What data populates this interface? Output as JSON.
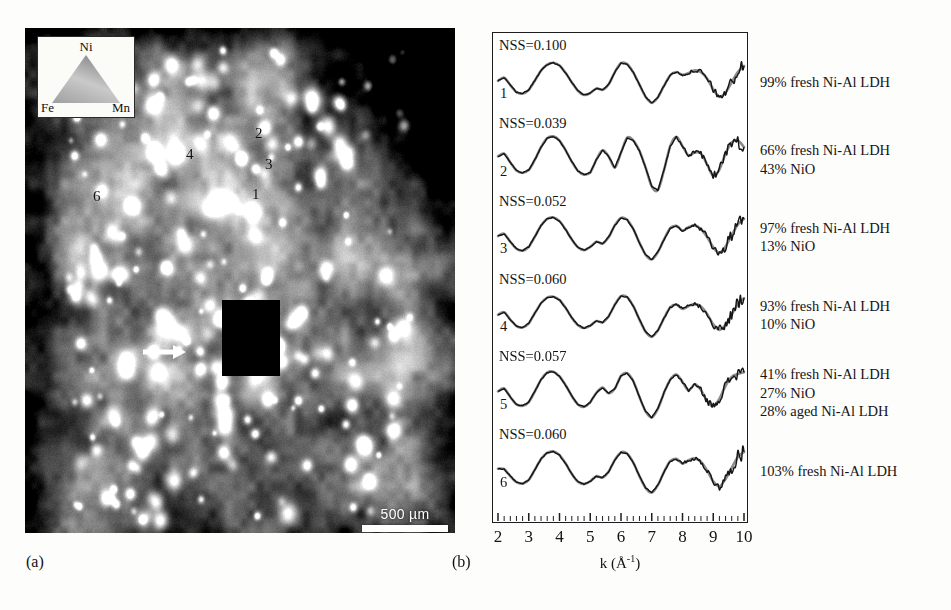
{
  "figure": {
    "panel_a_caption": "(a)",
    "panel_b_caption": "(b)"
  },
  "map": {
    "name": "elemental-distribution-map",
    "scalebar": {
      "label": "500 µm",
      "length_um": 500
    },
    "ternary_legend": {
      "top": "Ni",
      "bottom_left": "Fe",
      "bottom_right": "Mn"
    },
    "markers": [
      {
        "label": "1",
        "x": 252,
        "y": 186
      },
      {
        "label": "2",
        "x": 255,
        "y": 125
      },
      {
        "label": "3",
        "x": 265,
        "y": 156
      },
      {
        "label": "4",
        "x": 186,
        "y": 146
      },
      {
        "label": "6",
        "x": 93,
        "y": 188
      }
    ],
    "arrow": {
      "name": "white-arrow-pointer",
      "direction": "right"
    },
    "colors": {
      "background": "#6f6f6f",
      "bright_grain": "#f2f2f2",
      "dark_void": "#0d0d0d",
      "scalebar": "#ffffff"
    }
  },
  "chart_data": {
    "type": "line",
    "title": "",
    "xlabel": "k (Å-1)",
    "ylabel": "",
    "xlim": [
      2,
      10
    ],
    "xticks": [
      2,
      3,
      4,
      5,
      6,
      7,
      8,
      9,
      10
    ],
    "minor_ticks_per_interval": 5,
    "grid": false,
    "legend": "none",
    "stacked_offset": true,
    "series_pairs": [
      "data",
      "fit"
    ],
    "colors": {
      "data": "#151515",
      "fit": "#8c8c8c"
    },
    "spectra": [
      {
        "index": 1,
        "nss_label": "NSS=0.100",
        "nss": 0.1,
        "annotation": [
          "99% fresh Ni-Al LDH"
        ],
        "components": [
          {
            "phase": "fresh Ni-Al LDH",
            "percent": 99
          }
        ],
        "k": [
          2.0,
          2.2,
          2.4,
          2.6,
          2.8,
          3.0,
          3.2,
          3.4,
          3.6,
          3.8,
          4.0,
          4.2,
          4.4,
          4.6,
          4.8,
          5.0,
          5.2,
          5.4,
          5.6,
          5.8,
          6.0,
          6.2,
          6.4,
          6.6,
          6.8,
          7.0,
          7.2,
          7.4,
          7.6,
          7.8,
          8.0,
          8.2,
          8.4,
          8.6,
          8.8,
          9.0,
          9.2,
          9.4,
          9.6,
          9.8,
          10.0
        ],
        "chi": [
          0.08,
          0.22,
          -0.1,
          -0.4,
          -0.46,
          -0.3,
          0.1,
          0.52,
          0.78,
          0.86,
          0.74,
          0.42,
          0.02,
          -0.34,
          -0.52,
          -0.44,
          -0.24,
          -0.3,
          -0.06,
          0.46,
          0.84,
          0.8,
          0.44,
          -0.08,
          -0.6,
          -0.86,
          -0.62,
          -0.12,
          0.32,
          0.46,
          0.34,
          0.42,
          0.54,
          0.46,
          0.18,
          -0.28,
          -0.6,
          -0.42,
          0.02,
          0.46,
          0.72
        ]
      },
      {
        "index": 2,
        "nss_label": "NSS=0.039",
        "nss": 0.039,
        "annotation": [
          "66% fresh Ni-Al LDH",
          "43% NiO"
        ],
        "components": [
          {
            "phase": "fresh Ni-Al LDH",
            "percent": 66
          },
          {
            "phase": "NiO",
            "percent": 43
          }
        ],
        "k": [
          2.0,
          2.2,
          2.4,
          2.6,
          2.8,
          3.0,
          3.2,
          3.4,
          3.6,
          3.8,
          4.0,
          4.2,
          4.4,
          4.6,
          4.8,
          5.0,
          5.2,
          5.4,
          5.6,
          5.8,
          6.0,
          6.2,
          6.4,
          6.6,
          6.8,
          7.0,
          7.2,
          7.4,
          7.6,
          7.8,
          8.0,
          8.2,
          8.4,
          8.6,
          8.8,
          9.0,
          9.2,
          9.4,
          9.6,
          9.8,
          10.0
        ],
        "chi": [
          0.18,
          0.3,
          -0.08,
          -0.42,
          -0.52,
          -0.4,
          0.04,
          0.58,
          0.96,
          1.04,
          0.86,
          0.44,
          -0.04,
          -0.44,
          -0.6,
          -0.5,
          0.04,
          0.44,
          0.18,
          -0.3,
          0.34,
          0.98,
          0.86,
          0.42,
          -0.3,
          -1.1,
          -1.26,
          -0.4,
          0.62,
          1.02,
          0.62,
          0.22,
          0.36,
          0.3,
          -0.16,
          -0.66,
          -0.38,
          0.3,
          0.78,
          0.86,
          0.58
        ]
      },
      {
        "index": 3,
        "nss_label": "NSS=0.052",
        "nss": 0.052,
        "annotation": [
          "97% fresh Ni-Al LDH",
          "13% NiO"
        ],
        "components": [
          {
            "phase": "fresh Ni-Al LDH",
            "percent": 97
          },
          {
            "phase": "NiO",
            "percent": 13
          }
        ],
        "k": [
          2.0,
          2.2,
          2.4,
          2.6,
          2.8,
          3.0,
          3.2,
          3.4,
          3.6,
          3.8,
          4.0,
          4.2,
          4.4,
          4.6,
          4.8,
          5.0,
          5.2,
          5.4,
          5.6,
          5.8,
          6.0,
          6.2,
          6.4,
          6.6,
          6.8,
          7.0,
          7.2,
          7.4,
          7.6,
          7.8,
          8.0,
          8.2,
          8.4,
          8.6,
          8.8,
          9.0,
          9.2,
          9.4,
          9.6,
          9.8,
          10.0
        ],
        "chi": [
          0.1,
          0.2,
          -0.14,
          -0.44,
          -0.52,
          -0.36,
          0.08,
          0.56,
          0.84,
          0.9,
          0.74,
          0.38,
          -0.04,
          -0.38,
          -0.5,
          -0.36,
          -0.14,
          -0.22,
          0.06,
          0.56,
          0.88,
          0.8,
          0.4,
          -0.18,
          -0.7,
          -0.9,
          -0.58,
          -0.04,
          0.44,
          0.54,
          0.34,
          0.48,
          0.56,
          0.4,
          0.06,
          -0.38,
          -0.62,
          -0.34,
          0.14,
          0.6,
          0.84
        ]
      },
      {
        "index": 4,
        "nss_label": "NSS=0.060",
        "nss": 0.06,
        "annotation": [
          "93% fresh Ni-Al LDH",
          "10% NiO"
        ],
        "components": [
          {
            "phase": "fresh Ni-Al LDH",
            "percent": 93
          },
          {
            "phase": "NiO",
            "percent": 10
          }
        ],
        "k": [
          2.0,
          2.2,
          2.4,
          2.6,
          2.8,
          3.0,
          3.2,
          3.4,
          3.6,
          3.8,
          4.0,
          4.2,
          4.4,
          4.6,
          4.8,
          5.0,
          5.2,
          5.4,
          5.6,
          5.8,
          6.0,
          6.2,
          6.4,
          6.6,
          6.8,
          7.0,
          7.2,
          7.4,
          7.6,
          7.8,
          8.0,
          8.2,
          8.4,
          8.6,
          8.8,
          9.0,
          9.2,
          9.4,
          9.6,
          9.8,
          10.0
        ],
        "chi": [
          0.06,
          0.18,
          -0.14,
          -0.42,
          -0.48,
          -0.3,
          0.14,
          0.56,
          0.8,
          0.84,
          0.7,
          0.36,
          -0.06,
          -0.38,
          -0.5,
          -0.4,
          -0.2,
          -0.26,
          0.0,
          0.5,
          0.86,
          0.82,
          0.44,
          -0.14,
          -0.66,
          -0.88,
          -0.6,
          -0.08,
          0.38,
          0.5,
          0.32,
          0.44,
          0.52,
          0.42,
          0.1,
          -0.34,
          -0.58,
          -0.36,
          0.08,
          0.52,
          0.78
        ]
      },
      {
        "index": 5,
        "nss_label": "NSS=0.057",
        "nss": 0.057,
        "annotation": [
          "41% fresh Ni-Al LDH",
          "27% NiO",
          "28% aged Ni-Al LDH"
        ],
        "components": [
          {
            "phase": "fresh Ni-Al LDH",
            "percent": 41
          },
          {
            "phase": "NiO",
            "percent": 27
          },
          {
            "phase": "aged Ni-Al LDH",
            "percent": 28
          }
        ],
        "k": [
          2.0,
          2.2,
          2.4,
          2.6,
          2.8,
          3.0,
          3.2,
          3.4,
          3.6,
          3.8,
          4.0,
          4.2,
          4.4,
          4.6,
          4.8,
          5.0,
          5.2,
          5.4,
          5.6,
          5.8,
          6.0,
          6.2,
          6.4,
          6.6,
          6.8,
          7.0,
          7.2,
          7.4,
          7.6,
          7.8,
          8.0,
          8.2,
          8.4,
          8.6,
          8.8,
          9.0,
          9.2,
          9.4,
          9.6,
          9.8,
          10.0
        ],
        "chi": [
          0.12,
          0.24,
          -0.12,
          -0.44,
          -0.5,
          -0.34,
          0.12,
          0.62,
          0.92,
          0.96,
          0.76,
          0.38,
          -0.08,
          -0.44,
          -0.54,
          -0.34,
          0.06,
          0.28,
          0.04,
          0.24,
          0.78,
          0.9,
          0.56,
          -0.12,
          -0.74,
          -1.0,
          -0.62,
          0.06,
          0.62,
          0.84,
          0.52,
          0.16,
          0.42,
          0.18,
          -0.3,
          -0.52,
          -0.2,
          0.36,
          0.74,
          0.86,
          0.94
        ]
      },
      {
        "index": 6,
        "nss_label": "NSS=0.060",
        "nss": 0.06,
        "annotation": [
          "103% fresh Ni-Al LDH"
        ],
        "components": [
          {
            "phase": "fresh Ni-Al LDH",
            "percent": 103
          }
        ],
        "k": [
          2.0,
          2.2,
          2.4,
          2.6,
          2.8,
          3.0,
          3.2,
          3.4,
          3.6,
          3.8,
          4.0,
          4.2,
          4.4,
          4.6,
          4.8,
          5.0,
          5.2,
          5.4,
          5.6,
          5.8,
          6.0,
          6.2,
          6.4,
          6.6,
          6.8,
          7.0,
          7.2,
          7.4,
          7.6,
          7.8,
          8.0,
          8.2,
          8.4,
          8.6,
          8.8,
          9.0,
          9.2,
          9.4,
          9.6,
          9.8,
          10.0
        ],
        "chi": [
          0.14,
          0.12,
          -0.18,
          -0.44,
          -0.5,
          -0.34,
          0.1,
          0.56,
          0.82,
          0.88,
          0.72,
          0.36,
          -0.08,
          -0.42,
          -0.52,
          -0.4,
          -0.18,
          -0.24,
          0.02,
          0.52,
          0.84,
          0.78,
          0.4,
          -0.18,
          -0.68,
          -0.88,
          -0.56,
          0.0,
          0.46,
          0.56,
          0.36,
          0.5,
          0.58,
          0.44,
          0.06,
          -0.4,
          -0.62,
          -0.3,
          0.18,
          0.64,
          0.86
        ]
      }
    ]
  }
}
